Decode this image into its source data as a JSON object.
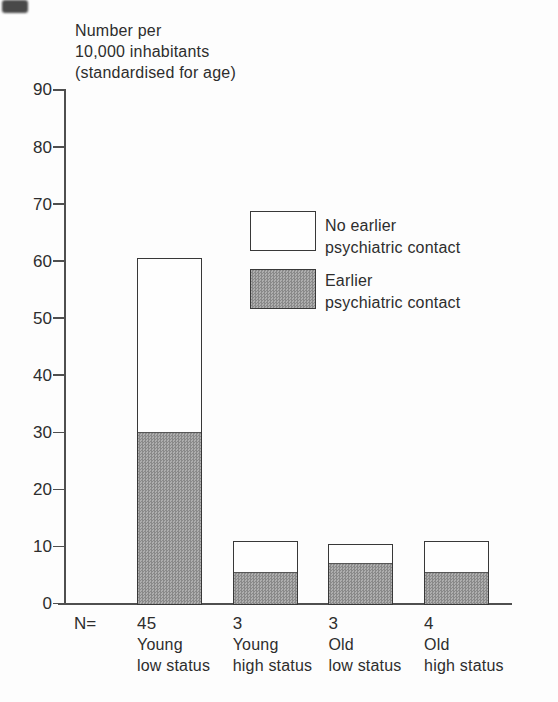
{
  "title": {
    "lines": [
      "Number per",
      "10,000 inhabitants",
      "(standardised for age)"
    ]
  },
  "y_axis": {
    "ticks": [
      0,
      10,
      20,
      30,
      40,
      50,
      60,
      70,
      80,
      90
    ]
  },
  "legend": {
    "no_earlier": {
      "lines": [
        "No earlier",
        "psychiatric contact"
      ],
      "swatch": "white"
    },
    "earlier": {
      "lines": [
        "Earlier",
        "psychiatric contact"
      ],
      "swatch": "halftone-gray"
    }
  },
  "x_axis": {
    "n_prefix": "N=",
    "categories": [
      {
        "n": "45",
        "lines": [
          "Young",
          "low status"
        ]
      },
      {
        "n": "3",
        "lines": [
          "Young",
          "high status"
        ]
      },
      {
        "n": "3",
        "lines": [
          "Old",
          "low status"
        ]
      },
      {
        "n": "4",
        "lines": [
          "Old",
          "high status"
        ]
      }
    ]
  },
  "chart_data": {
    "type": "bar",
    "subtype": "stacked",
    "title": "Number per 10,000 inhabitants (standardised for age)",
    "categories": [
      "Young low status",
      "Young high status",
      "Old low status",
      "Old high status"
    ],
    "n_values": [
      45,
      3,
      3,
      4
    ],
    "series": [
      {
        "name": "Earlier psychiatric contact",
        "values": [
          30,
          5.5,
          7,
          5.5
        ],
        "fill": "halftone-gray"
      },
      {
        "name": "No earlier psychiatric contact",
        "values": [
          30.5,
          5.5,
          3.5,
          5.5
        ],
        "fill": "white"
      }
    ],
    "totals": [
      60.5,
      11,
      10.5,
      11
    ],
    "ylim": [
      0,
      90
    ],
    "ytick_step": 10,
    "grid": false,
    "legend_position": "inside-upper-right"
  },
  "colors": {
    "axis": "#4f4f4f",
    "bar_border": "#383838",
    "halftone_dark": "#898989",
    "halftone_light": "#aeaeae",
    "text": "#2d2d2d"
  }
}
